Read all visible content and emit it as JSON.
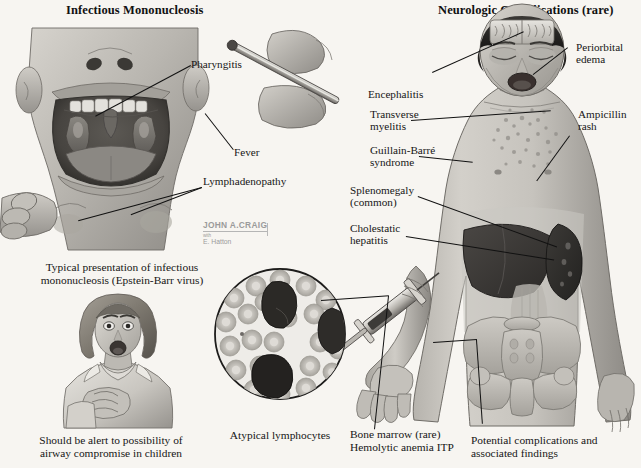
{
  "plate": {
    "background_color": "#f7f5f1",
    "ink_color": "#161616"
  },
  "titles": {
    "left": "Infectious Mononucleosis",
    "right": "Neurologic Complications (rare)"
  },
  "left_panel": {
    "labels": [
      {
        "id": "pharyngitis",
        "text": "Pharyngitis"
      },
      {
        "id": "fever",
        "text": "Fever"
      },
      {
        "id": "lymphadenopathy",
        "text": "Lymphadenopathy"
      }
    ],
    "captions": [
      {
        "id": "typical-presentation",
        "text": "Typical presentation of infectious\nmononucleosis (Epstein-Barr virus)"
      },
      {
        "id": "airway-warning",
        "text": "Should be alert to possibility of\nairway compromise in children"
      }
    ]
  },
  "right_panel": {
    "labels_left_column": [
      {
        "id": "encephalitis",
        "text": "Encephalitis"
      },
      {
        "id": "transverse-myelitis",
        "text": "Transverse\nmyelitis"
      },
      {
        "id": "guillain-barre",
        "text": "Guillain-Barré\nsyndrome"
      },
      {
        "id": "splenomegaly",
        "text": "Splenomegaly\n(common)"
      },
      {
        "id": "cholestatic-hepatitis",
        "text": "Cholestatic\nhepatitis"
      }
    ],
    "labels_right_column": [
      {
        "id": "periorbital-edema",
        "text": "Periorbital\nedema"
      },
      {
        "id": "ampicillin-rash",
        "text": "Ampicillin\nrash"
      }
    ],
    "captions": [
      {
        "id": "bone-marrow",
        "text": "Bone marrow (rare)\nHemolytic anemia ITP"
      },
      {
        "id": "potential-complications",
        "text": "Potential complications and\nassociated findings"
      }
    ]
  },
  "micrograph": {
    "caption": "Atypical lymphocytes"
  },
  "signature": {
    "name": "JOHN A.CRAIG",
    "credential": "MD",
    "with_label": "with",
    "second_artist": "E. Hatton"
  }
}
